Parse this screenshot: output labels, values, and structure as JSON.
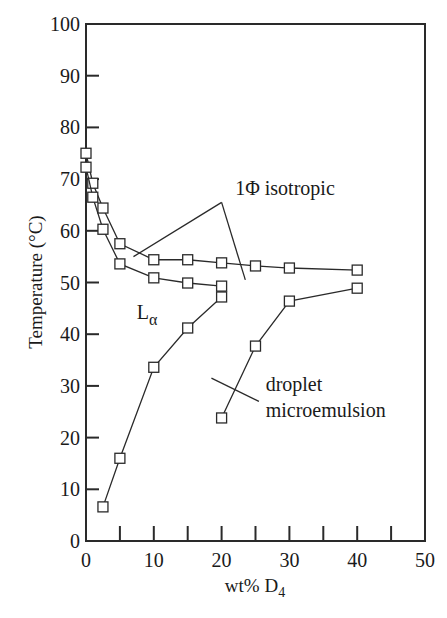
{
  "chart_data": {
    "type": "line",
    "title": "",
    "xlabel": "wt% D",
    "xlabel_subscript": "4",
    "ylabel": "Temperature (°C)",
    "xlim": [
      0,
      50
    ],
    "ylim": [
      0,
      100
    ],
    "x_ticks": [
      0,
      10,
      20,
      30,
      40,
      50
    ],
    "x_minor_ticks": [
      5,
      15,
      25,
      35,
      45
    ],
    "y_ticks": [
      0,
      10,
      20,
      30,
      40,
      50,
      60,
      70,
      80,
      90,
      100
    ],
    "grid": false,
    "legend": null,
    "marker": "open-square",
    "series": [
      {
        "name": "upper boundary (1Φ isotropic / Lα+ upper)",
        "points": [
          [
            0,
            75
          ],
          [
            1,
            69.2
          ],
          [
            2.5,
            64.4
          ],
          [
            5,
            57.5
          ],
          [
            10,
            54.4
          ],
          [
            15,
            54.4
          ],
          [
            20,
            53.8
          ],
          [
            25,
            53.2
          ],
          [
            30,
            52.8
          ],
          [
            40,
            52.4
          ]
        ]
      },
      {
        "name": "Lα upper boundary",
        "points": [
          [
            0,
            72.3
          ],
          [
            1,
            66.5
          ],
          [
            2.5,
            60.3
          ],
          [
            5,
            53.6
          ],
          [
            10,
            50.9
          ],
          [
            15,
            49.9
          ],
          [
            20,
            49.3
          ]
        ]
      },
      {
        "name": "Lα lower boundary",
        "points": [
          [
            2.5,
            6.6
          ],
          [
            5,
            16
          ],
          [
            10,
            33.6
          ],
          [
            15,
            41.2
          ],
          [
            20,
            47.2
          ]
        ]
      },
      {
        "name": "droplet microemulsion boundary",
        "points": [
          [
            20,
            23.8
          ],
          [
            25,
            37.7
          ],
          [
            30,
            46.4
          ],
          [
            40,
            48.9
          ]
        ]
      }
    ],
    "annotations": [
      {
        "text": "1Φ isotropic",
        "x": 22,
        "y": 67,
        "leaders": [
          [
            [
              20,
              65.5
            ],
            [
              7,
              55
            ]
          ],
          [
            [
              20,
              65.5
            ],
            [
              23.5,
              50.5
            ]
          ]
        ]
      },
      {
        "text": "L",
        "subscript": "α",
        "x": 7.5,
        "y": 43
      },
      {
        "text": "droplet",
        "x": 26.5,
        "y": 29
      },
      {
        "text": "microemulsion",
        "x": 26.5,
        "y": 24
      },
      {
        "text": "",
        "leaders": [
          [
            [
              18.5,
              31.5
            ],
            [
              25.5,
              27
            ]
          ]
        ]
      }
    ]
  }
}
